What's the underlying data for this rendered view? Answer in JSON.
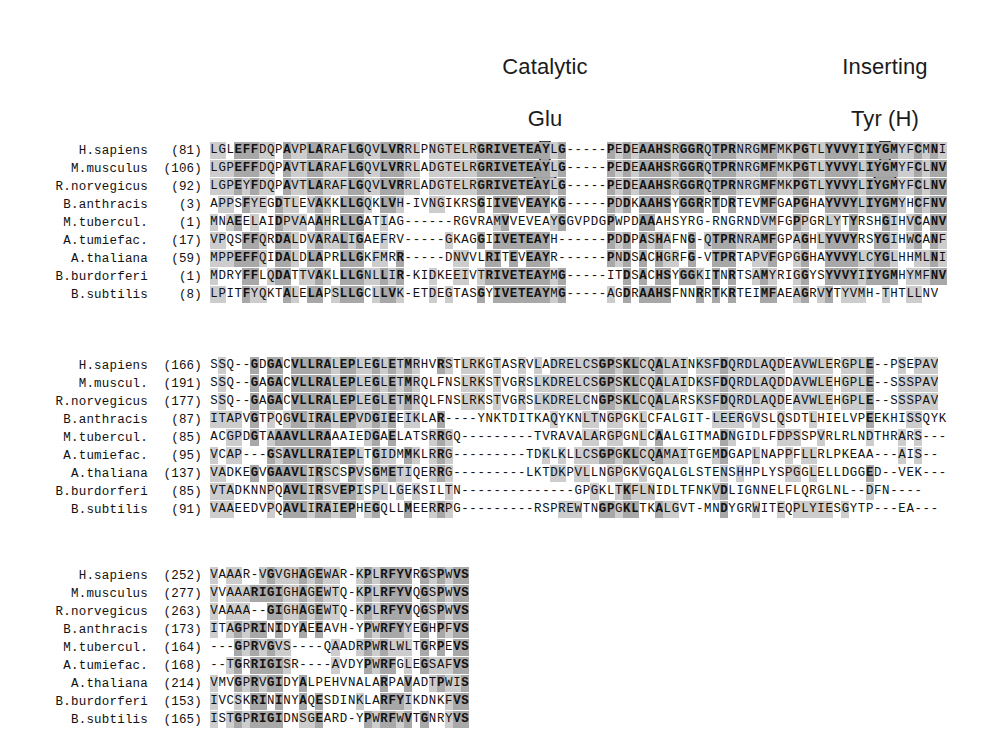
{
  "figure": {
    "type": "multiple-sequence-alignment",
    "species_count": 9,
    "block_count": 3,
    "shading_legend": {
      "dark": "identical / strongly conserved",
      "light": "similar residue",
      "none": "not conserved"
    },
    "colors": {
      "shade_dark": "#a8a8a8",
      "shade_light": "#cdcdcd",
      "arrow_fill": "#a0a0a0",
      "arrow_stroke": "#1b1b1b",
      "text": "#111111",
      "background": "#ffffff"
    }
  },
  "annotations": [
    {
      "id": "catalytic-glu",
      "label": "Catalytic\nGlu",
      "line1": "Catalytic",
      "line2": "Glu",
      "icon": "down-arrow-icon",
      "x": 545,
      "y": 28,
      "points_at_column": 41
    },
    {
      "id": "inserting-tyr",
      "label": "Inserting\nTyr (H)",
      "line1": "Inserting",
      "line2": "Tyr (H)",
      "icon": "down-arrow-icon",
      "x": 885,
      "y": 28,
      "points_at_column": 83
    }
  ],
  "species": [
    "H.sapiens",
    "M.musculus",
    "R.norvegicus",
    "B.anthracis",
    "M.tubercul.",
    "A.tumiefac.",
    "A.thaliana",
    "B.burdorferi",
    "B.subtilis"
  ],
  "blocks": [
    {
      "id": "block-1",
      "top": 142,
      "rows": [
        {
          "name": "H.sapiens",
          "pos": "(81)",
          "seq": "LGLEFFDQPAVPLARAFLGQVLVRRLPNGTELRGRIVETEAYLG-----PEDEAAHSRGGRQTPRNRGMFMKPGTLYVVYIIYGMYFCMNI"
        },
        {
          "name": "M.musculus",
          "pos": "(106)",
          "seq": "LGPEFFDQPAVTLARAFLGQVLVRRLADGTELRGRIVETEAYLG-----PEDEAAHSRGGRQTPRNRGMFMKPGTLYVVYLIYGMYFCLNV"
        },
        {
          "name": "R.norvegicus",
          "pos": "(92)",
          "seq": "LGPEYFDQPAVTLARAFLGQVLVRRLADGTELRGRIVETEAYLG-----PEDEAAHSRGGRQTPRNRGMFMKPGTLYVVYLIYGMYFCLNV"
        },
        {
          "name": "B.anthracis",
          "pos": "(3)",
          "seq": "APPSFYEGDTLEVAKKLLGQKLVH-IVNGIKRSGIIVEVEAYKG-----PDDKAAHSYGGRRTDRTEVMFGAPGHAYVVYLIYGMYHCFNV"
        },
        {
          "name": "M.tubercul.",
          "pos": "(1)",
          "seq": "MNAEELAIDPVAAAHRLLGATIAG------RGVRAMVVEVEAYGGVPDGPWPDAAAHSYRG-RNGRNDVMFGPPGRLYTYRSHGIHVCANV"
        },
        {
          "name": "A.tumiefac.",
          "pos": "(17)",
          "seq": "VPQSFFQRDALDVARALIGAEFRV-----GKAGGIIVETEAYH------PDDPASHAFNG-QTPRNRAMFGPAGHLYVVYRSYGIHWCANF"
        },
        {
          "name": "A.thaliana",
          "pos": "(59)",
          "seq": "MPPEFFQIDALDLAPRLLGKFMRR-----DNVVLRITEVEAYR------PNDSACHGRFG-VTPRTAPVFGPGGHAYVVYLCYGLHHMLNI"
        },
        {
          "name": "B.burdorferi",
          "pos": "(1)",
          "seq": "MDRYFFLQDATTVAKLLLGNLLIR-KIDKEEIVTRIVETEAYMG-----ITDSACHSYGGKITNRTSAMYRIGGYSYVVYIIYGMHYMFNV"
        },
        {
          "name": "B.subtilis",
          "pos": "(8)",
          "seq": "LPITFYQKTALELAPSLLGCLLVK-ETDEGTASGYIVETEAYMG-----AGDRAAHSFNNRRTKRTEIMFAEAGRVYTYVMH-THTLLNV"
        }
      ]
    },
    {
      "id": "block-2",
      "top": 357,
      "rows": [
        {
          "name": "H.sapiens",
          "pos": "(166)",
          "seq": "SSQ--GDGACVLLRALEPLEGLETMRHVRSTLRKGTASRVLADRELCSGPSKLCQALAINKSFDQRDLAQDEAVWLERGPLE--PSEPAV"
        },
        {
          "name": "M.muscul.",
          "pos": "(191)",
          "seq": "SSQ--GAGACVLLRALEPLEGLETMRQLFNSLRKSTVGRSLKDRELCSGPSKLCQALAIDKSFDQRDLAQDDAVWLEHGPLE--SSSPAV"
        },
        {
          "name": "R.norvegicus",
          "pos": "(177)",
          "seq": "SSQ--GAGACVLLRALEPLEGLETMRQLFNSLRKSTVGRSLKDRELCNGPSKLCQALARSKSFDQRDLAQDEAVWLEHGPLE--SSSPAV"
        },
        {
          "name": "B.anthracis",
          "pos": "(87)",
          "seq": "ITAPVGTPQGVLIRALEPVDGIEEIKLAR----YNKTDITKAQYKNLTNGPGKLCFALGIT-LEERGVSLQSDTLHIELVPEEKHISSQYK"
        },
        {
          "name": "M.tubercul.",
          "pos": "(85)",
          "seq": "ACGPDGTAAAVLLRAAAIEDGAELATSRRGQ---------TVRAVALARGPGNLCAALGITMADNGIDLFDPSSPVRLRLNDTHRARS---"
        },
        {
          "name": "A.tumiefac.",
          "pos": "(95)",
          "seq": "VCAP---GSAVLLRAIEPLTGIDMMKLRRG---------TDKLKLLCSGPGKLCQAMAITGEMDGAPLNAPPFLLRLPKEAA---AIS--"
        },
        {
          "name": "A.thaliana",
          "pos": "(137)",
          "seq": "VADKEGVGAAVLIRSCSPVSGMETIQERRG---------LKTDKPVLLNGPGKVGQALGLSTENSHHPLYSPGGLELLDGGED--VEK---"
        },
        {
          "name": "B.burdorferi",
          "pos": "(85)",
          "seq": "VTADKNNPQAVLIRSVEPISPLLGEKSILTN--------------GPGKLTKFLNIDLTFNKVDLIGNNELFLQRGLNL--DFN----"
        },
        {
          "name": "B.subtilis",
          "pos": "(91)",
          "seq": "VAAEEDVPQAVLIRAIEPHEGQLLMEERRPG---------RSPREWTNGPGKLTKALGVT-MNDYGRWITEQPLYIESGYTP---EA---"
        }
      ]
    },
    {
      "id": "block-3",
      "top": 567,
      "rows": [
        {
          "name": "H.sapiens",
          "pos": "(252)",
          "seq": "VAAAR-VGVGHAGEWAR-KPLRFYVRGSPWVS"
        },
        {
          "name": "M.musculus",
          "pos": "(277)",
          "seq": "VVAAARIGIGHAGEWTQ-KPLRFYVQGSPWVS"
        },
        {
          "name": "R.norvegicus",
          "pos": "(263)",
          "seq": "VAAAA--GIGHAGEWTQ-KPLRFYVQGSPWVS"
        },
        {
          "name": "B.anthracis",
          "pos": "(173)",
          "seq": "ITAGPRINIDYAEEAVH-YPWRFYYEGHPFVS"
        },
        {
          "name": "M.tubercul.",
          "pos": "(164)",
          "seq": "---GPRVGVS----QAADRPWRLWLTGRPEVS"
        },
        {
          "name": "A.tumiefac.",
          "pos": "(168)",
          "seq": "--TGRRIGISR----AVDYPWRFGLEGSAFVS"
        },
        {
          "name": "A.thaliana",
          "pos": "(214)",
          "seq": "VMVGPRVGIDYALPEHVNALARPAVADTPWIS"
        },
        {
          "name": "B.burdorferi",
          "pos": "(153)",
          "seq": "IVCSKRININYAQESDINKLARFYIKDNKFVS"
        },
        {
          "name": "B.subtilis",
          "pos": "(165)",
          "seq": "ISTGPRIGIDNSGEARD-YPWRFWVTGNRYVS"
        }
      ]
    }
  ]
}
